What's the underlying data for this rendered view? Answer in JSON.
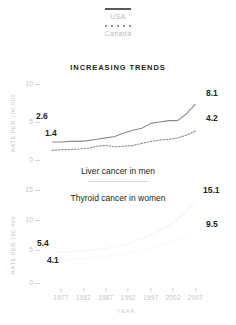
{
  "legend": {
    "series": [
      {
        "name": "USA",
        "style": "solid",
        "color": "#58595b"
      },
      {
        "name": "Canada",
        "style": "dotted",
        "color": "#8d8f91"
      }
    ]
  },
  "headline": "INCREASING TRENDS",
  "axis": {
    "ylabel": "RATE PER 100,000",
    "xlabel": "YEAR",
    "xticks": [
      "1977",
      "1982",
      "1987",
      "1992",
      "1997",
      "2002",
      "2007"
    ]
  },
  "captions": {
    "top": "Liver cancer in men",
    "bottom": "Thyroid cancer in women"
  },
  "chart_data": [
    {
      "type": "line",
      "title": "Liver cancer in men",
      "xlabel": "YEAR",
      "ylabel": "RATE PER 100,000",
      "ylim": [
        0,
        11
      ],
      "yticks": [
        0,
        5,
        10
      ],
      "ytick_labels": [
        "0",
        "5",
        "10"
      ],
      "xlim": [
        1975,
        2008
      ],
      "x": [
        1975,
        1977,
        1979,
        1981,
        1983,
        1985,
        1987,
        1989,
        1991,
        1993,
        1995,
        1997,
        1999,
        2001,
        2003,
        2005,
        2007
      ],
      "grid": false,
      "legend_position": "top-center",
      "series": [
        {
          "name": "USA",
          "style": "solid",
          "color": "#8a8c8e",
          "start_label": "2.6",
          "end_label": "8.1",
          "values": [
            2.6,
            2.6,
            2.7,
            2.7,
            2.8,
            3.0,
            3.2,
            3.4,
            3.9,
            4.3,
            4.6,
            5.3,
            5.5,
            5.7,
            5.7,
            6.7,
            8.1
          ]
        },
        {
          "name": "Canada",
          "style": "dotted",
          "color": "#8a8c8e",
          "start_label": "1.4",
          "end_label": "4.2",
          "values": [
            1.4,
            1.5,
            1.5,
            1.6,
            1.7,
            2.0,
            2.1,
            1.9,
            2.0,
            2.1,
            2.4,
            2.7,
            2.9,
            3.0,
            3.2,
            3.6,
            4.2
          ]
        }
      ]
    },
    {
      "type": "line",
      "title": "Thyroid cancer in women",
      "xlabel": "YEAR",
      "ylabel": "RATE PER 100,000",
      "ylim": [
        0,
        17
      ],
      "yticks": [
        0,
        5,
        10,
        15
      ],
      "ytick_labels": [
        "0",
        "5",
        "10",
        "15"
      ],
      "xlim": [
        1975,
        2008
      ],
      "x": [
        1975,
        1977,
        1979,
        1981,
        1983,
        1985,
        1987,
        1989,
        1991,
        1993,
        1995,
        1997,
        1999,
        2001,
        2003,
        2005,
        2007
      ],
      "grid": false,
      "series": [
        {
          "name": "USA",
          "style": "solid",
          "color": "#f4f5f6",
          "start_label": "5.4",
          "end_label": "15.1",
          "values": [
            5.4,
            5.5,
            5.6,
            5.7,
            5.8,
            6.0,
            6.2,
            6.5,
            6.9,
            7.4,
            8.0,
            8.7,
            9.5,
            10.4,
            11.6,
            13.0,
            15.1
          ]
        },
        {
          "name": "Canada",
          "style": "dotted",
          "color": "#f6f7f8",
          "start_label": "4.1",
          "end_label": "9.5",
          "values": [
            4.1,
            4.1,
            4.2,
            4.3,
            4.4,
            4.5,
            4.7,
            4.9,
            5.2,
            5.5,
            5.9,
            6.3,
            6.8,
            7.3,
            7.9,
            8.6,
            9.5
          ]
        }
      ]
    }
  ]
}
